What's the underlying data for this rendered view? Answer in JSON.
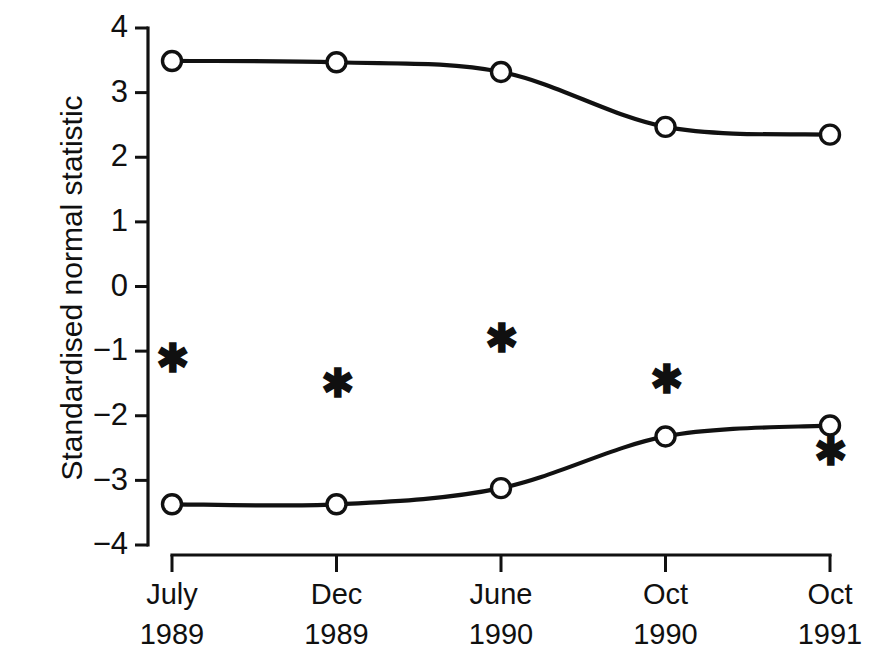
{
  "chart_data": {
    "type": "line",
    "title": "",
    "xlabel": "",
    "ylabel": "Standardised normal statistic",
    "categories": [
      "July\n1989",
      "Dec\n1989",
      "June\n1990",
      "Oct\n1990",
      "Oct\n1991"
    ],
    "x_tick_labels": [
      {
        "month": "July",
        "year": "1989"
      },
      {
        "month": "Dec",
        "year": "1989"
      },
      {
        "month": "June",
        "year": "1990"
      },
      {
        "month": "Oct",
        "year": "1990"
      },
      {
        "month": "Oct",
        "year": "1991"
      }
    ],
    "y_tick_labels": [
      "4",
      "3",
      "2",
      "1",
      "0",
      "−1",
      "−2",
      "−3",
      "−4"
    ],
    "y_ticks": [
      4,
      3,
      2,
      1,
      0,
      -1,
      -2,
      -3,
      -4
    ],
    "ylim": [
      -4,
      4
    ],
    "grid": false,
    "legend": false,
    "series": [
      {
        "name": "upper-boundary",
        "marker": "open-circle",
        "line_style": "solid",
        "color": "#111111",
        "values": [
          3.49,
          3.47,
          3.32,
          2.47,
          2.35
        ]
      },
      {
        "name": "lower-boundary",
        "marker": "open-circle",
        "line_style": "solid",
        "color": "#111111",
        "values": [
          -3.37,
          -3.37,
          -3.12,
          -2.32,
          -2.15
        ]
      },
      {
        "name": "observed-statistic",
        "marker": "asterisk",
        "line_style": "none",
        "color": "#111111",
        "values": [
          -1.16,
          -1.55,
          -0.85,
          -1.48,
          -2.6
        ]
      }
    ]
  }
}
